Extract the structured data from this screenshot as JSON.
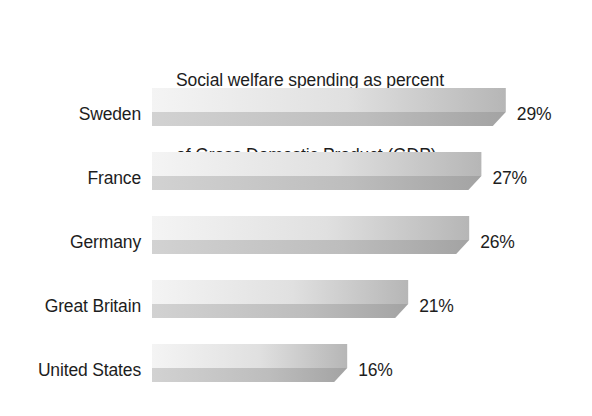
{
  "chart_data": {
    "type": "bar",
    "orientation": "horizontal",
    "title": "Social welfare spending as percent of Gross Domestic Product (GDP)",
    "title_lines": [
      "Social welfare spending as percent",
      "of Gross Domestic Product (GDP)"
    ],
    "categories": [
      "Sweden",
      "France",
      "Germany",
      "Great Britain",
      "United States"
    ],
    "values": [
      29,
      27,
      26,
      21,
      16
    ],
    "value_labels": [
      "29%",
      "27%",
      "26%",
      "21%",
      "16%"
    ],
    "unit": "percent of GDP",
    "xlabel": "",
    "ylabel": "",
    "xlim": [
      0,
      34
    ],
    "grid": false,
    "legend": false,
    "axis_lines": false,
    "tick_labels": [],
    "style": {
      "bar_top_light": "#f4f4f4",
      "bar_top_dark": "#b6b6b6",
      "bar_front_light": "#d2d2d2",
      "bar_front_dark": "#a3a3a3",
      "bar_side": "#9a9a9a",
      "background": "#ffffff",
      "text": "#1d1d1d"
    }
  },
  "figure": {
    "background_color": "#ffffff",
    "text_color": "#1d1d1d"
  }
}
